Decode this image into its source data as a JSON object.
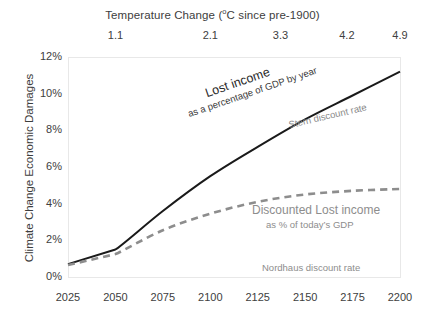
{
  "chart_data": {
    "type": "line",
    "title": "",
    "xlabel": "",
    "ylabel": "Climate Change Economic Damages",
    "top_axis_title": "Temperature Change (",
    "top_axis_title_sup": "o",
    "top_axis_title_rest": "C since pre-1900)",
    "x": [
      2025,
      2050,
      2075,
      2100,
      2125,
      2150,
      2175,
      2200
    ],
    "xlim": [
      2025,
      2200
    ],
    "ylim": [
      0,
      12
    ],
    "grid": false,
    "legend": "none",
    "x_tick_labels": [
      "2025",
      "2050",
      "2075",
      "2100",
      "2125",
      "2150",
      "2175",
      "2200"
    ],
    "y_tick_labels": [
      "0%",
      "2%",
      "4%",
      "6%",
      "8%",
      "10%",
      "12%"
    ],
    "y_ticks": [
      0,
      2,
      4,
      6,
      8,
      10,
      12
    ],
    "top_tick_labels": [
      "1.1",
      "2.1",
      "3.3",
      "4.2",
      "4.9"
    ],
    "top_tick_x": [
      2050,
      2100,
      2137,
      2172,
      2200
    ],
    "series": [
      {
        "name": "Lost income",
        "style": "solid",
        "color": "#1a1a1a",
        "values": [
          0.7,
          1.5,
          3.6,
          5.5,
          7.1,
          8.6,
          9.9,
          11.2
        ]
      },
      {
        "name": "Discounted Lost income",
        "style": "dashed",
        "color": "#8d8d8d",
        "values": [
          0.65,
          1.25,
          2.55,
          3.45,
          4.1,
          4.5,
          4.7,
          4.8
        ]
      }
    ],
    "annotations": [
      {
        "id": "lost-income-title",
        "text": "Lost income"
      },
      {
        "id": "lost-income-subtitle",
        "text": "as a percentage of GDP by year"
      },
      {
        "id": "stern-discount-rate",
        "text": "Stern discount rate"
      },
      {
        "id": "discounted-lost-income-title",
        "text": "Discounted Lost income"
      },
      {
        "id": "discounted-lost-income-subtitle",
        "text": "as % of today’s GDP"
      },
      {
        "id": "nordhaus-discount-rate",
        "text": "Nordhaus discount rate"
      }
    ]
  },
  "colors": {
    "lost_income_line": "#1a1a1a",
    "discounted_line": "#8d8d8d",
    "axis_text": "#404040",
    "plot_border": "#e4e4e4",
    "background": "#ffffff"
  }
}
